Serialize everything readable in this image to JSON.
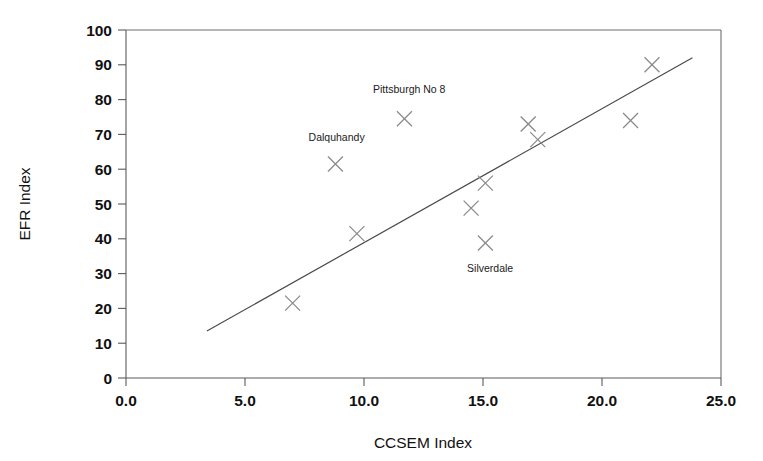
{
  "chart_data": {
    "type": "scatter",
    "title": "",
    "xlabel": "CCSEM Index",
    "ylabel": "EFR Index",
    "xlim": [
      0.0,
      25.0
    ],
    "ylim": [
      0,
      100
    ],
    "grid": false,
    "legend": "none",
    "x_ticks": [
      "0.0",
      "5.0",
      "10.0",
      "15.0",
      "20.0",
      "25.0"
    ],
    "x_tick_values": [
      0.0,
      5.0,
      10.0,
      15.0,
      20.0,
      25.0
    ],
    "y_ticks": [
      "0",
      "10",
      "20",
      "30",
      "40",
      "50",
      "60",
      "70",
      "80",
      "90",
      "100"
    ],
    "y_tick_values": [
      0,
      10,
      20,
      30,
      40,
      50,
      60,
      70,
      80,
      90,
      100
    ],
    "marker_style": "x-cross",
    "points": [
      {
        "x": 7.0,
        "y": 21.5,
        "label": ""
      },
      {
        "x": 8.8,
        "y": 61.5,
        "label": "Dalquhandy"
      },
      {
        "x": 9.7,
        "y": 41.5,
        "label": ""
      },
      {
        "x": 11.7,
        "y": 74.5,
        "label": "Pittsburgh No 8"
      },
      {
        "x": 14.5,
        "y": 48.8,
        "label": ""
      },
      {
        "x": 15.1,
        "y": 56.0,
        "label": ""
      },
      {
        "x": 15.1,
        "y": 38.8,
        "label": "Silverdale"
      },
      {
        "x": 16.9,
        "y": 73.0,
        "label": ""
      },
      {
        "x": 17.3,
        "y": 68.5,
        "label": ""
      },
      {
        "x": 21.2,
        "y": 74.0,
        "label": ""
      },
      {
        "x": 22.1,
        "y": 90.0,
        "label": ""
      }
    ],
    "annotations": [
      {
        "text": "Pittsburgh No 8",
        "x": 11.9,
        "y": 82.0
      },
      {
        "text": "Dalquhandy",
        "x": 8.85,
        "y": 68.0
      },
      {
        "text": "Silverdale",
        "x": 15.3,
        "y": 30.5
      }
    ],
    "trend_line": {
      "type": "linear-fit",
      "x_start": 3.4,
      "y_start": 13.5,
      "x_end": 23.8,
      "y_end": 92.0
    },
    "colors": {
      "marker": "#8a8a8a",
      "trend": "#4a4a4a",
      "axis": "#5a5a5a",
      "text": "#111111",
      "background": "#ffffff"
    }
  }
}
